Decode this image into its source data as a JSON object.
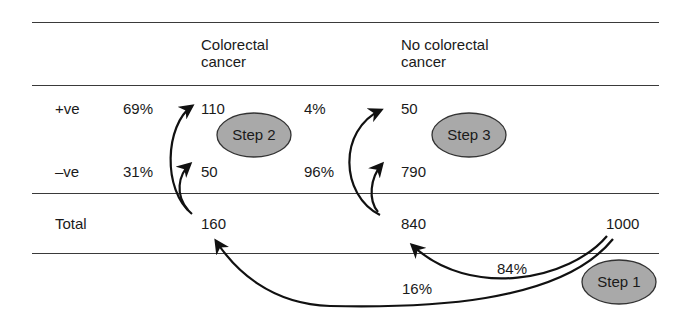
{
  "table": {
    "columns": [
      "Colorectal cancer",
      "No colorectal cancer"
    ],
    "column_header_lines": {
      "colorectal": [
        "Colorectal",
        "cancer"
      ],
      "no_colorectal": [
        "No colorectal",
        "cancer"
      ]
    },
    "rows": [
      {
        "label": "+ve",
        "colorectal_pct": "69%",
        "colorectal": "110",
        "no_colorectal_pct": "4%",
        "no_colorectal": "50"
      },
      {
        "label": "–ve",
        "colorectal_pct": "31%",
        "colorectal": "50",
        "no_colorectal_pct": "96%",
        "no_colorectal": "790"
      }
    ],
    "total": {
      "label": "Total",
      "colorectal": "160",
      "no_colorectal": "840",
      "grand_total": "1000"
    }
  },
  "flows": {
    "to_no_colorectal_pct": "84%",
    "to_colorectal_pct": "16%"
  },
  "steps": [
    {
      "label": "Step 1"
    },
    {
      "label": "Step 2"
    },
    {
      "label": "Step 3"
    }
  ],
  "colors": {
    "step_fill": "#a9a9a9",
    "step_stroke": "#333333",
    "rule": "#3a3a3a",
    "arrow": "#111111"
  }
}
